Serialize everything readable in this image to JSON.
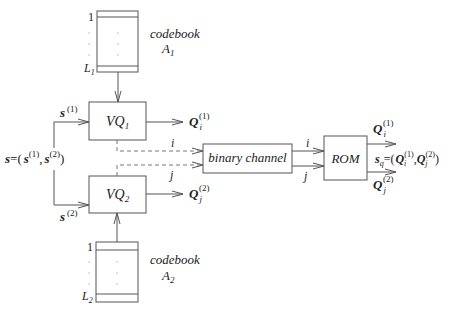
{
  "codebook1": {
    "label": "codebook",
    "name": "A",
    "sub": "1",
    "first_index": "1",
    "last_index": "L",
    "last_sub": "1"
  },
  "codebook2": {
    "label": "codebook",
    "name": "A",
    "sub": "2",
    "first_index": "1",
    "last_index": "L",
    "last_sub": "2"
  },
  "vq1": {
    "name": "VQ",
    "sub": "1"
  },
  "vq2": {
    "name": "VQ",
    "sub": "2"
  },
  "channel": {
    "label": "binary channel"
  },
  "rom": {
    "label": "ROM"
  },
  "input": {
    "s": "s",
    "eq": "=(",
    "s1": "s",
    "s1_sup": "(1)",
    "comma": ",",
    "s2": "s",
    "s2_sup": "(2)",
    "close": ")"
  },
  "branch1": {
    "s": "s",
    "sup": "(1)"
  },
  "branch2": {
    "s": "s",
    "sup": "(2)"
  },
  "out1": {
    "Q": "Q",
    "sub": "i",
    "sup": "(1)"
  },
  "out2": {
    "Q": "Q",
    "sub": "j",
    "sup": "(2)"
  },
  "index_i": "i",
  "index_j": "j",
  "rom_out1": {
    "Q": "Q",
    "sub": "i",
    "sup": "(1)"
  },
  "rom_out2": {
    "Q": "Q",
    "sub": "j",
    "sup": "(2)"
  },
  "sq": {
    "s": "s",
    "s_sub": "q",
    "eq": "=(",
    "q1": "Q",
    "q1_sub": "i",
    "q1_sup": "(1)",
    "comma": ",",
    "q2": "Q",
    "q2_sub": "j",
    "q2_sup": "(2)",
    "close": ")"
  }
}
